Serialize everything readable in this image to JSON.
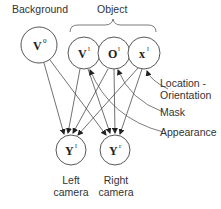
{
  "labels": {
    "background": "Background",
    "object": "Object",
    "location_orientation_1": "Location -",
    "location_orientation_2": "Orientation",
    "mask": "Mask",
    "appearance": "Appearance",
    "left_camera_1": "Left",
    "left_camera_2": "camera",
    "right_camera_1": "Right",
    "right_camera_2": "camera"
  },
  "nodes": {
    "v0": {
      "symbol": "V",
      "sup": "0"
    },
    "vl": {
      "symbol": "V",
      "sup": "l"
    },
    "ol": {
      "symbol": "O",
      "sup": "l"
    },
    "xl": {
      "symbol": "x",
      "sup": "l"
    },
    "yl": {
      "symbol": "Y",
      "sup": "l"
    },
    "yr": {
      "symbol": "Y",
      "sup": "r"
    }
  }
}
